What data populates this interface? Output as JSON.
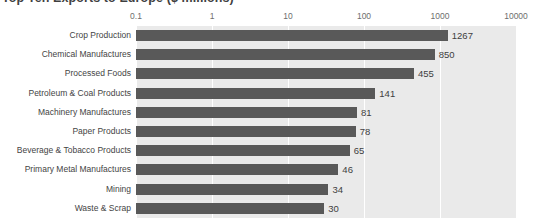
{
  "chart_data": {
    "type": "bar",
    "orientation": "horizontal",
    "title": "Top Ten Exports to Europe ($ millions)",
    "xlabel": "",
    "ylabel": "",
    "xscale": "log",
    "xlim": [
      0.1,
      10000
    ],
    "xticks": [
      "0.1",
      "1",
      "10",
      "100",
      "1000",
      "10000"
    ],
    "xtick_values": [
      0.1,
      1,
      10,
      100,
      1000,
      10000
    ],
    "grid": true,
    "grid_axis": "x",
    "legend": "none",
    "categories": [
      "Crop Production",
      "Chemical Manufactures",
      "Processed Foods",
      "Petroleum & Coal Products",
      "Machinery Manufactures",
      "Paper Products",
      "Beverage & Tobacco Products",
      "Primary Metal Manufactures",
      "Mining",
      "Waste & Scrap"
    ],
    "values": [
      1267,
      850,
      455,
      141,
      81,
      78,
      65,
      46,
      34,
      30
    ],
    "value_labels": [
      "1267",
      "850",
      "455",
      "141",
      "81",
      "78",
      "65",
      "46",
      "34",
      "30"
    ],
    "colors": {
      "bar": "#595959",
      "plot_background": "#eaeaea",
      "gridline": "#ffffff",
      "figure_background": "#ffffff",
      "title_text": "#3f3f3f",
      "tick_text": "#6e6e6e",
      "category_text": "#444444",
      "value_text": "#404040"
    }
  }
}
